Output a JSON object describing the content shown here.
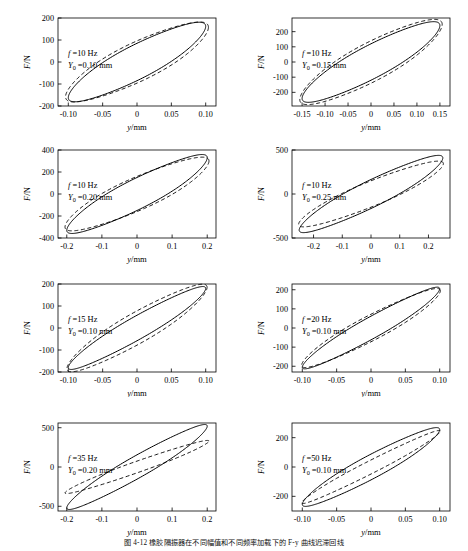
{
  "figure": {
    "caption": "图 4-12   橡胶隔振器在不同幅值和不同频率加载下的 F-y 曲线迟滞回线",
    "axis_labels": {
      "x": "y/mm",
      "y": "F/N"
    },
    "series": [
      {
        "name": "experimental",
        "style": "solid"
      },
      {
        "name": "model-prediction",
        "style": "dashed"
      }
    ]
  },
  "chart_data": [
    {
      "type": "line",
      "title": "",
      "xlabel": "y/mm",
      "ylabel": "F/N",
      "xlim": [
        -0.115,
        0.115
      ],
      "ylim": [
        -200,
        200
      ],
      "xticks": [
        -0.1,
        -0.05,
        0,
        0.05,
        0.1
      ],
      "xticklabels": [
        "-0.10",
        "-0.05",
        "0",
        "0.05",
        "0.10"
      ],
      "yticks": [
        -200,
        -100,
        0,
        100,
        200
      ],
      "yticklabels": [
        "-200",
        "-100",
        "0",
        "100",
        "200"
      ],
      "grid": false,
      "annotations": {
        "frequency": "f =10 Hz",
        "amplitude": "Y0 =0.10 mm",
        "f_value": 10,
        "Y0_value": 0.1
      },
      "series": [
        {
          "name": "experimental",
          "style": "solid",
          "loop": {
            "amplitude_x": 0.1,
            "amplitude_y": 162,
            "tilt_force": 150,
            "width_force": 85,
            "phase_deg": 0
          }
        },
        {
          "name": "model-prediction",
          "style": "dashed",
          "loop": {
            "amplitude_x": 0.104,
            "amplitude_y": 158,
            "tilt_force": 143,
            "width_force": 96,
            "phase_deg": 0
          }
        }
      ]
    },
    {
      "type": "line",
      "title": "",
      "xlabel": "y/mm",
      "ylabel": "F/N",
      "xlim": [
        -0.172,
        0.172
      ],
      "ylim": [
        -290,
        290
      ],
      "xticks": [
        -0.15,
        -0.1,
        -0.05,
        0,
        0.05,
        0.1,
        0.15
      ],
      "xticklabels": [
        "-0.15",
        "-0.10",
        "-0.05",
        "0",
        "0.05",
        "0.10",
        "0.15"
      ],
      "yticks": [
        -200,
        -100,
        0,
        100,
        200
      ],
      "yticklabels": [
        "-200",
        "-100",
        "0",
        "100",
        "200"
      ],
      "grid": false,
      "annotations": {
        "frequency": "f =10 Hz",
        "amplitude": "Y0 =0.15 mm",
        "f_value": 10,
        "Y0_value": 0.15
      },
      "series": [
        {
          "name": "experimental",
          "style": "solid",
          "loop": {
            "amplitude_x": 0.15,
            "amplitude_y": 240,
            "tilt_force": 225,
            "width_force": 120,
            "phase_deg": 0
          }
        },
        {
          "name": "model-prediction",
          "style": "dashed",
          "loop": {
            "amplitude_x": 0.155,
            "amplitude_y": 248,
            "tilt_force": 228,
            "width_force": 140,
            "phase_deg": 0
          }
        }
      ]
    },
    {
      "type": "line",
      "title": "",
      "xlabel": "y/mm",
      "ylabel": "F/N",
      "xlim": [
        -0.225,
        0.225
      ],
      "ylim": [
        -400,
        400
      ],
      "xticks": [
        -0.2,
        -0.1,
        0,
        0.1,
        0.2
      ],
      "xticklabels": [
        "-0.2",
        "-0.1",
        "0",
        "0.1",
        "0.2"
      ],
      "yticks": [
        -400,
        -200,
        0,
        200,
        400
      ],
      "yticklabels": [
        "-400",
        "-200",
        "0",
        "200",
        "400"
      ],
      "grid": false,
      "annotations": {
        "frequency": "f =10 Hz",
        "amplitude": "Y0 =0.20 mm",
        "f_value": 10,
        "Y0_value": 0.2
      },
      "series": [
        {
          "name": "experimental",
          "style": "solid",
          "loop": {
            "amplitude_x": 0.2,
            "amplitude_y": 330,
            "tilt_force": 305,
            "width_force": 150,
            "phase_deg": 0
          }
        },
        {
          "name": "model-prediction",
          "style": "dashed",
          "loop": {
            "amplitude_x": 0.205,
            "amplitude_y": 300,
            "tilt_force": 272,
            "width_force": 160,
            "phase_deg": 0
          }
        }
      ]
    },
    {
      "type": "line",
      "title": "",
      "xlabel": "y/mm",
      "ylabel": "F/N",
      "xlim": [
        -0.275,
        0.275
      ],
      "ylim": [
        -500,
        500
      ],
      "xticks": [
        -0.2,
        -0.1,
        0,
        0.1,
        0.2
      ],
      "xticklabels": [
        "-0.2",
        "-0.1",
        "0",
        "0.1",
        "0.2"
      ],
      "yticks": [
        -500,
        0,
        500
      ],
      "yticklabels": [
        "-500",
        "0",
        "500"
      ],
      "grid": false,
      "annotations": {
        "frequency": "f =10 Hz",
        "amplitude": "Y0 =0.25 mm",
        "f_value": 10,
        "Y0_value": 0.25
      },
      "series": [
        {
          "name": "experimental",
          "style": "solid",
          "loop": {
            "amplitude_x": 0.25,
            "amplitude_y": 410,
            "tilt_force": 385,
            "width_force": 165,
            "phase_deg": 0
          }
        },
        {
          "name": "model-prediction",
          "style": "dashed",
          "loop": {
            "amplitude_x": 0.252,
            "amplitude_y": 345,
            "tilt_force": 325,
            "width_force": 150,
            "phase_deg": 0
          }
        }
      ]
    },
    {
      "type": "line",
      "title": "",
      "xlabel": "y/mm",
      "ylabel": "F/N",
      "xlim": [
        -0.115,
        0.115
      ],
      "ylim": [
        -200,
        200
      ],
      "xticks": [
        -0.1,
        -0.05,
        0,
        0.05,
        0.1
      ],
      "xticklabels": [
        "-0.10",
        "-0.05",
        "0",
        "0.05",
        "0.10"
      ],
      "yticks": [
        -200,
        -100,
        0,
        100,
        200
      ],
      "yticklabels": [
        "-200",
        "-100",
        "0",
        "100",
        "200"
      ],
      "grid": false,
      "annotations": {
        "frequency": "f =15 Hz",
        "amplitude": "Y0 =0.10 mm",
        "f_value": 15,
        "Y0_value": 0.1
      },
      "series": [
        {
          "name": "experimental",
          "style": "solid",
          "loop": {
            "amplitude_x": 0.1,
            "amplitude_y": 180,
            "tilt_force": 172,
            "width_force": 58,
            "phase_deg": 0
          }
        },
        {
          "name": "model-prediction",
          "style": "dashed",
          "loop": {
            "amplitude_x": 0.102,
            "amplitude_y": 185,
            "tilt_force": 172,
            "width_force": 78,
            "phase_deg": 0
          }
        }
      ]
    },
    {
      "type": "line",
      "title": "",
      "xlabel": "y/mm",
      "ylabel": "F/N",
      "xlim": [
        -0.115,
        0.115
      ],
      "ylim": [
        -230,
        230
      ],
      "xticks": [
        -0.1,
        -0.05,
        0,
        0.05,
        0.1
      ],
      "xticklabels": [
        "-0.10",
        "-0.05",
        "0",
        "0.05",
        "0.10"
      ],
      "yticks": [
        -200,
        -100,
        0,
        100,
        200
      ],
      "yticklabels": [
        "-200",
        "-100",
        "0",
        "100",
        "200"
      ],
      "grid": false,
      "annotations": {
        "frequency": "f =20 Hz",
        "amplitude": "Y0 =0.10 mm",
        "f_value": 20,
        "Y0_value": 0.1
      },
      "series": [
        {
          "name": "experimental",
          "style": "solid",
          "loop": {
            "amplitude_x": 0.1,
            "amplitude_y": 205,
            "tilt_force": 195,
            "width_force": 62,
            "phase_deg": 0
          }
        },
        {
          "name": "model-prediction",
          "style": "dashed",
          "loop": {
            "amplitude_x": 0.101,
            "amplitude_y": 195,
            "tilt_force": 182,
            "width_force": 72,
            "phase_deg": 0
          }
        }
      ]
    },
    {
      "type": "line",
      "title": "",
      "xlabel": "y/mm",
      "ylabel": "F/N",
      "xlim": [
        -0.225,
        0.225
      ],
      "ylim": [
        -560,
        560
      ],
      "xticks": [
        -0.2,
        -0.1,
        0,
        0.1,
        0.2
      ],
      "xticklabels": [
        "-0.2",
        "-0.1",
        "0",
        "0.1",
        "0.2"
      ],
      "yticks": [
        -500,
        0,
        500
      ],
      "yticklabels": [
        "-500",
        "0",
        "500"
      ],
      "grid": false,
      "annotations": {
        "frequency": "f =35 Hz",
        "amplitude": "Y0 =0.20 mm",
        "f_value": 35,
        "Y0_value": 0.2
      },
      "series": [
        {
          "name": "experimental",
          "style": "solid",
          "loop": {
            "amplitude_x": 0.2,
            "amplitude_y": 520,
            "tilt_force": 495,
            "width_force": 155,
            "phase_deg": 0
          }
        },
        {
          "name": "model-prediction",
          "style": "dashed",
          "loop": {
            "amplitude_x": 0.205,
            "amplitude_y": 330,
            "tilt_force": 320,
            "width_force": 75,
            "phase_deg": 0
          }
        }
      ]
    },
    {
      "type": "line",
      "title": "",
      "xlabel": "y/mm",
      "ylabel": "F/N",
      "xlim": [
        -0.115,
        0.115
      ],
      "ylim": [
        -300,
        300
      ],
      "xticks": [
        -0.1,
        -0.05,
        0,
        0.05,
        0.1
      ],
      "xticklabels": [
        "-0.10",
        "-0.05",
        "0",
        "0.05",
        "0.10"
      ],
      "yticks": [
        -200,
        0,
        200
      ],
      "yticklabels": [
        "-200",
        "0",
        "200"
      ],
      "grid": false,
      "annotations": {
        "frequency": "f =50 Hz",
        "amplitude": "Y0 =0.10 mm",
        "f_value": 50,
        "Y0_value": 0.1
      },
      "series": [
        {
          "name": "experimental",
          "style": "solid",
          "loop": {
            "amplitude_x": 0.1,
            "amplitude_y": 255,
            "tilt_force": 242,
            "width_force": 88,
            "phase_deg": 0
          }
        },
        {
          "name": "model-prediction",
          "style": "dashed",
          "loop": {
            "amplitude_x": 0.101,
            "amplitude_y": 245,
            "tilt_force": 238,
            "width_force": 48,
            "phase_deg": 0
          }
        }
      ]
    }
  ]
}
